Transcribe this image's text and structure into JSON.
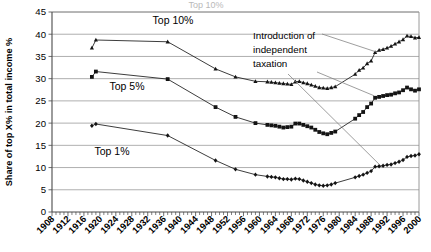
{
  "axes": {
    "ylabel": "Share of top X% in total income %",
    "ytick_labels": [
      "0",
      "5",
      "10",
      "15",
      "20",
      "25",
      "30",
      "35",
      "40",
      "45"
    ],
    "xtick_labels": [
      "1908",
      "1912",
      "1916",
      "1920",
      "1924",
      "1928",
      "1932",
      "1936",
      "1940",
      "1944",
      "1948",
      "1952",
      "1956",
      "1960",
      "1964",
      "1968",
      "1972",
      "1976",
      "1980",
      "1984",
      "1988",
      "1992",
      "1996",
      "2000"
    ]
  },
  "annotations": {
    "series_label_top10": "Top 10%",
    "series_label_top5": "Top 5%",
    "series_label_top1": "Top 1%",
    "callout_line1": "Introduction of",
    "callout_line2": "independent",
    "callout_line3": "taxation",
    "clipped_title": "Top 10%"
  },
  "colors": {
    "line": "#1a1a1a",
    "grid": "#9a9a9a",
    "axis": "#4a4a4a",
    "leader": "#7d7d7d",
    "background": "#ffffff"
  },
  "chart_data": {
    "type": "line",
    "title": "",
    "xlabel": "",
    "ylabel": "Share of top X% in total income %",
    "ylim": [
      0,
      45
    ],
    "xlim": [
      1908,
      2000
    ],
    "grid": true,
    "legend": "inline-labels",
    "series": [
      {
        "name": "Top 10%",
        "marker": "triangle",
        "x": [
          1918,
          1919,
          1937,
          1949,
          1954,
          1959,
          1962,
          1963,
          1964,
          1965,
          1966,
          1967,
          1968,
          1969,
          1970,
          1971,
          1972,
          1973,
          1974,
          1975,
          1976,
          1977,
          1978,
          1979,
          1984,
          1985,
          1986,
          1987,
          1988,
          1989,
          1990,
          1991,
          1992,
          1993,
          1994,
          1995,
          1996,
          1997,
          1998,
          1999,
          2000
        ],
        "values": [
          36.9,
          38.7,
          38.3,
          32.2,
          30.4,
          29.4,
          29.3,
          29.2,
          29.1,
          29.0,
          28.9,
          28.8,
          28.7,
          29.3,
          29.4,
          29.1,
          28.9,
          28.6,
          28.3,
          28.0,
          27.9,
          27.8,
          28.0,
          28.2,
          31.0,
          31.9,
          32.4,
          33.4,
          34.0,
          35.9,
          36.4,
          36.6,
          36.9,
          37.3,
          37.8,
          38.3,
          38.8,
          39.6,
          39.5,
          39.2,
          39.3
        ]
      },
      {
        "name": "Top 5%",
        "marker": "square",
        "x": [
          1918,
          1919,
          1937,
          1949,
          1954,
          1959,
          1962,
          1963,
          1964,
          1965,
          1966,
          1967,
          1968,
          1969,
          1970,
          1971,
          1972,
          1973,
          1974,
          1975,
          1976,
          1977,
          1978,
          1979,
          1984,
          1985,
          1986,
          1987,
          1988,
          1989,
          1990,
          1991,
          1992,
          1993,
          1994,
          1995,
          1996,
          1997,
          1998,
          1999,
          2000
        ],
        "values": [
          30.4,
          31.6,
          29.9,
          23.6,
          21.4,
          20.0,
          19.6,
          19.5,
          19.4,
          19.2,
          19.0,
          19.1,
          19.2,
          19.9,
          19.9,
          19.6,
          19.3,
          19.0,
          18.5,
          18.0,
          17.7,
          17.5,
          17.8,
          18.1,
          21.0,
          21.8,
          22.5,
          23.6,
          24.4,
          25.7,
          25.9,
          26.1,
          26.3,
          26.4,
          26.7,
          26.9,
          27.4,
          28.0,
          27.6,
          27.3,
          27.6
        ]
      },
      {
        "name": "Top 1%",
        "marker": "diamond",
        "x": [
          1918,
          1919,
          1937,
          1949,
          1954,
          1959,
          1962,
          1963,
          1964,
          1965,
          1966,
          1967,
          1968,
          1969,
          1970,
          1971,
          1972,
          1973,
          1974,
          1975,
          1976,
          1977,
          1978,
          1979,
          1984,
          1985,
          1986,
          1987,
          1988,
          1989,
          1990,
          1991,
          1992,
          1993,
          1994,
          1995,
          1996,
          1997,
          1998,
          1999,
          2000
        ],
        "values": [
          19.4,
          19.8,
          17.2,
          11.6,
          9.6,
          8.4,
          8.0,
          7.9,
          7.8,
          7.6,
          7.4,
          7.4,
          7.3,
          7.5,
          7.4,
          7.1,
          6.8,
          6.5,
          6.2,
          6.0,
          5.9,
          6.0,
          6.2,
          6.5,
          7.8,
          8.1,
          8.4,
          8.8,
          9.2,
          10.2,
          10.3,
          10.4,
          10.6,
          10.7,
          11.0,
          11.3,
          11.7,
          12.4,
          12.6,
          12.7,
          13.0
        ]
      }
    ]
  }
}
